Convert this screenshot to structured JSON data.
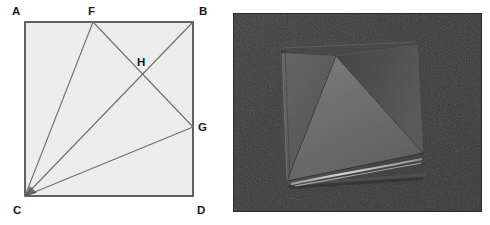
{
  "figure": {
    "caption": "",
    "panels": [
      {
        "id": "geometry-diagram",
        "kind": "line-diagram"
      },
      {
        "id": "origami-photo",
        "kind": "photograph"
      }
    ]
  },
  "geometry": {
    "shape": "square",
    "fill_color": "#ececec",
    "stroke_color": "#3d3d3d",
    "line_color": "#6e6e6e",
    "square": {
      "top_left": {
        "label": "A",
        "x": 25,
        "y": 22
      },
      "top_right": {
        "label": "B",
        "x": 193,
        "y": 22
      },
      "bottom_left": {
        "label": "C",
        "x": 25,
        "y": 196
      },
      "bottom_right": {
        "label": "D",
        "x": 193,
        "y": 196
      }
    },
    "points": [
      {
        "label": "A",
        "x": 25,
        "y": 22,
        "label_x": 12,
        "label_y": 15,
        "on": "corner"
      },
      {
        "label": "B",
        "x": 193,
        "y": 22,
        "label_x": 199,
        "label_y": 15,
        "on": "corner"
      },
      {
        "label": "C",
        "x": 25,
        "y": 196,
        "label_x": 13,
        "label_y": 214,
        "on": "corner"
      },
      {
        "label": "D",
        "x": 193,
        "y": 196,
        "label_x": 197,
        "label_y": 214,
        "on": "corner"
      },
      {
        "label": "F",
        "x": 93,
        "y": 22,
        "label_x": 88,
        "label_y": 15,
        "on": "top-edge"
      },
      {
        "label": "G",
        "x": 193,
        "y": 127,
        "label_x": 198,
        "label_y": 131,
        "on": "right-edge"
      },
      {
        "label": "H",
        "x": 141,
        "y": 78,
        "label_x": 137,
        "label_y": 66,
        "on": "intersection"
      }
    ],
    "segments": [
      {
        "name": "CF",
        "from": "C",
        "to": "F"
      },
      {
        "name": "CB",
        "from": "C",
        "to": "B"
      },
      {
        "name": "CG",
        "from": "C",
        "to": "G"
      },
      {
        "name": "FG",
        "from": "F",
        "to": "G"
      }
    ],
    "labels": {
      "A": "A",
      "B": "B",
      "C": "C",
      "D": "D",
      "F": "F",
      "G": "G",
      "H": "H"
    }
  },
  "photo": {
    "subject": "folded square paper model",
    "background_color": "#3a3a3a",
    "paper": {
      "base_color": "#4a4a4a",
      "light_face_color": "#6b6b6b",
      "mid_face_color": "#565656",
      "dark_face_color": "#3c3c3c",
      "highlight_color": "#c9c9c9",
      "shadow_color": "#2e2e2e"
    },
    "frame": {
      "x": 233,
      "y": 13,
      "width": 249,
      "height": 199
    }
  }
}
